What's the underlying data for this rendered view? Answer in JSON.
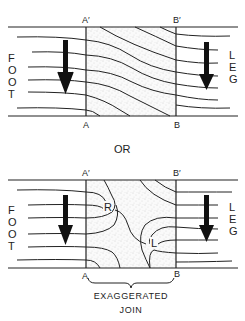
{
  "diagram": {
    "separator_label": "OR",
    "top_panel": {
      "left_region_label": "FOOT",
      "right_region_label": "LEG",
      "boundary_labels": {
        "a_top": "A′",
        "b_top": "B′",
        "a_bottom": "A",
        "b_bottom": "B"
      },
      "description": "Ridges pass smoothly and diagonally through the stippled join region between A–A′ and B–B′",
      "arrow_direction": "down"
    },
    "bottom_panel": {
      "left_region_label": "FOOT",
      "right_region_label": "LEG",
      "boundary_labels": {
        "a_top": "A′",
        "b_top": "B′",
        "a_bottom": "A",
        "b_bottom": "B"
      },
      "triradius_labels": {
        "r": "R",
        "l": "L"
      },
      "description": "Stippled join region contains two loop/triradius formations labeled R and L",
      "arrow_direction": "down",
      "brace_caption_line1": "EXAGGERATED",
      "brace_caption_line2": "JOIN"
    },
    "colors": {
      "ink": "#222222",
      "stipple": "#bbbbbb",
      "background": "#ffffff"
    }
  }
}
